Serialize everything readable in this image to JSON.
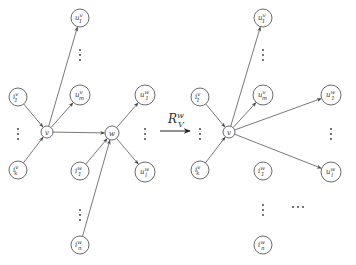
{
  "diagram": {
    "operator": {
      "symbol": "R",
      "sup": "w",
      "sub": "V"
    },
    "before": {
      "nodes": [
        {
          "id": "u1v",
          "base": "u",
          "sup": "v",
          "sub": "1",
          "x": 80,
          "y": 18,
          "r": 9
        },
        {
          "id": "umv",
          "base": "u",
          "sup": "v",
          "sub": "m",
          "x": 80,
          "y": 95,
          "r": 10
        },
        {
          "id": "i1v",
          "base": "i",
          "sup": "v",
          "sub": "1",
          "x": 18,
          "y": 97,
          "r": 9
        },
        {
          "id": "ikv",
          "base": "i",
          "sup": "v",
          "sub": "k",
          "x": 18,
          "y": 170,
          "r": 9
        },
        {
          "id": "v",
          "base": "v",
          "sup": "",
          "sub": "",
          "x": 47,
          "y": 132,
          "r": 6
        },
        {
          "id": "w",
          "base": "w",
          "sup": "",
          "sub": "",
          "x": 112,
          "y": 133,
          "r": 7
        },
        {
          "id": "u1w",
          "base": "u",
          "sup": "w",
          "sub": "1",
          "x": 145,
          "y": 95,
          "r": 10
        },
        {
          "id": "ulw",
          "base": "u",
          "sup": "w",
          "sub": "l",
          "x": 145,
          "y": 172,
          "r": 10
        },
        {
          "id": "i1w",
          "base": "i",
          "sup": "w",
          "sub": "1",
          "x": 80,
          "y": 171,
          "r": 9
        },
        {
          "id": "inw",
          "base": "i",
          "sup": "w",
          "sub": "n",
          "x": 80,
          "y": 245,
          "r": 9
        }
      ],
      "edges": [
        {
          "from": "v",
          "to": "u1v"
        },
        {
          "from": "v",
          "to": "umv"
        },
        {
          "from": "i1v",
          "to": "v"
        },
        {
          "from": "ikv",
          "to": "v"
        },
        {
          "from": "v",
          "to": "w"
        },
        {
          "from": "w",
          "to": "u1w"
        },
        {
          "from": "w",
          "to": "ulw"
        },
        {
          "from": "i1w",
          "to": "w"
        },
        {
          "from": "inw",
          "to": "w"
        }
      ],
      "ellipses": [
        {
          "dir": "v",
          "x": 80,
          "y": 55
        },
        {
          "dir": "v",
          "x": 18,
          "y": 134
        },
        {
          "dir": "v",
          "x": 145,
          "y": 134
        },
        {
          "dir": "v",
          "x": 80,
          "y": 215
        }
      ]
    },
    "after": {
      "nodes": [
        {
          "id": "u1v",
          "base": "u",
          "sup": "v",
          "sub": "1",
          "x": 263,
          "y": 18,
          "r": 9
        },
        {
          "id": "umv",
          "base": "u",
          "sup": "v",
          "sub": "m",
          "x": 263,
          "y": 95,
          "r": 10
        },
        {
          "id": "i1v",
          "base": "i",
          "sup": "v",
          "sub": "1",
          "x": 200,
          "y": 97,
          "r": 9
        },
        {
          "id": "ikv",
          "base": "i",
          "sup": "v",
          "sub": "k",
          "x": 200,
          "y": 170,
          "r": 9
        },
        {
          "id": "v",
          "base": "v",
          "sup": "",
          "sub": "",
          "x": 229,
          "y": 132,
          "r": 6
        },
        {
          "id": "u1w",
          "base": "u",
          "sup": "w",
          "sub": "1",
          "x": 331,
          "y": 95,
          "r": 10
        },
        {
          "id": "ulw",
          "base": "u",
          "sup": "w",
          "sub": "l",
          "x": 331,
          "y": 172,
          "r": 10
        },
        {
          "id": "i1w",
          "base": "i",
          "sup": "w",
          "sub": "1",
          "x": 263,
          "y": 171,
          "r": 9
        },
        {
          "id": "inw",
          "base": "i",
          "sup": "w",
          "sub": "n",
          "x": 263,
          "y": 245,
          "r": 9
        }
      ],
      "edges": [
        {
          "from": "v",
          "to": "u1v"
        },
        {
          "from": "v",
          "to": "umv"
        },
        {
          "from": "i1v",
          "to": "v"
        },
        {
          "from": "ikv",
          "to": "v"
        },
        {
          "from": "v",
          "to": "u1w"
        },
        {
          "from": "v",
          "to": "ulw"
        }
      ],
      "ellipses": [
        {
          "dir": "v",
          "x": 263,
          "y": 55
        },
        {
          "dir": "v",
          "x": 200,
          "y": 134
        },
        {
          "dir": "v",
          "x": 331,
          "y": 134
        },
        {
          "dir": "v",
          "x": 263,
          "y": 210
        },
        {
          "dir": "h",
          "x": 298,
          "y": 207
        }
      ]
    }
  }
}
